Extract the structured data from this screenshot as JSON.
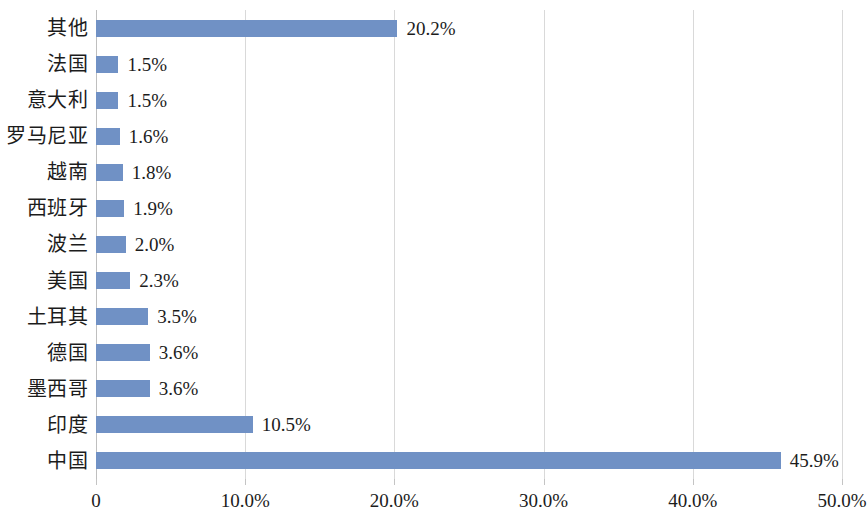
{
  "chart_data": {
    "type": "bar",
    "orientation": "horizontal",
    "title": "",
    "subtitle": "",
    "xlabel": "",
    "ylabel": "",
    "xlim": [
      0,
      50
    ],
    "ylim": null,
    "grid": true,
    "legend": null,
    "legend_position": "none",
    "value_suffix": "%",
    "bar_color": "#7091c5",
    "gridline_color": "#d9d9d9",
    "axis_color": "#bfbfbf",
    "text_color": "#1c1c1c",
    "background_color": "#ffffff",
    "xticks": [
      0,
      10,
      20,
      30,
      40,
      50
    ],
    "xtick_labels": [
      "0",
      "10.0%",
      "20.0%",
      "30.0%",
      "40.0%",
      "50.0%"
    ],
    "categories": [
      "其他",
      "法国",
      "意大利",
      "罗马尼亚",
      "越南",
      "西班牙",
      "波兰",
      "美国",
      "土耳其",
      "德国",
      "墨西哥",
      "印度",
      "中国"
    ],
    "values": [
      20.2,
      1.5,
      1.5,
      1.6,
      1.8,
      1.9,
      2.0,
      2.3,
      3.5,
      3.6,
      3.6,
      10.5,
      45.9
    ],
    "value_labels": [
      "20.2%",
      "1.5%",
      "1.5%",
      "1.6%",
      "1.8%",
      "1.9%",
      "2.0%",
      "2.3%",
      "3.5%",
      "3.6%",
      "3.6%",
      "10.5%",
      "45.9%"
    ]
  }
}
